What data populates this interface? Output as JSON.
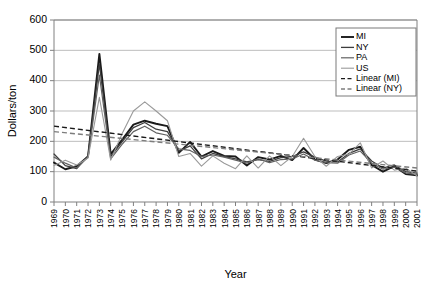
{
  "chart_data": {
    "type": "line",
    "title": "",
    "xlabel": "Year",
    "ylabel": "Dollars/ton",
    "xlim": [
      1969,
      2001
    ],
    "ylim": [
      0,
      600
    ],
    "ytick_step": 100,
    "yticks": [
      0,
      100,
      200,
      300,
      400,
      500,
      600
    ],
    "grid": "horizontal",
    "legend_position": "top-right",
    "categories": [
      "1969",
      "1970",
      "1971",
      "1972",
      "1973",
      "1974",
      "1975",
      "1976",
      "1977",
      "1978",
      "1979",
      "1980",
      "1981",
      "1982",
      "1983",
      "1984",
      "1985",
      "1986",
      "1987",
      "1988",
      "1989",
      "1990",
      "1991",
      "1992",
      "1993",
      "1994",
      "1995",
      "1996",
      "1997",
      "1998",
      "1999",
      "2000",
      "2001"
    ],
    "series": [
      {
        "name": "MI",
        "color": "#1a1a1a",
        "width": 1.9,
        "dash": "none",
        "values": [
          130,
          108,
          118,
          150,
          488,
          158,
          205,
          255,
          268,
          258,
          250,
          162,
          198,
          150,
          168,
          152,
          150,
          120,
          148,
          140,
          152,
          138,
          178,
          140,
          128,
          140,
          172,
          182,
          122,
          100,
          118,
          92,
          88
        ]
      },
      {
        "name": "NY",
        "color": "#3d3d3d",
        "width": 1.3,
        "dash": "none",
        "values": [
          158,
          120,
          110,
          152,
          455,
          150,
          198,
          245,
          262,
          240,
          232,
          168,
          185,
          142,
          160,
          150,
          142,
          132,
          140,
          134,
          146,
          150,
          165,
          148,
          135,
          132,
          160,
          175,
          135,
          112,
          122,
          100,
          95
        ]
      },
      {
        "name": "PA",
        "color": "#616161",
        "width": 1.2,
        "dash": "none",
        "values": [
          148,
          128,
          112,
          148,
          418,
          142,
          190,
          232,
          250,
          228,
          220,
          175,
          170,
          150,
          155,
          148,
          138,
          128,
          142,
          130,
          140,
          142,
          158,
          138,
          130,
          128,
          155,
          168,
          128,
          108,
          115,
          96,
          90
        ]
      },
      {
        "name": "US",
        "color": "#9a9a9a",
        "width": 1.1,
        "dash": "none",
        "values": [
          120,
          138,
          122,
          145,
          345,
          138,
          225,
          300,
          330,
          300,
          268,
          150,
          160,
          118,
          152,
          128,
          110,
          152,
          112,
          152,
          120,
          150,
          210,
          150,
          118,
          150,
          158,
          195,
          112,
          135,
          105,
          112,
          86
        ]
      }
    ],
    "trendlines": [
      {
        "name": "Linear (MI)",
        "color": "#1a1a1a",
        "width": 1.4,
        "dash": "5,3",
        "start": [
          1969,
          250
        ],
        "end": [
          2001,
          102
        ]
      },
      {
        "name": "Linear (NY)",
        "color": "#7d7d7d",
        "width": 1.4,
        "dash": "5,3",
        "start": [
          1969,
          232
        ],
        "end": [
          2001,
          112
        ]
      }
    ],
    "legend_entries": [
      {
        "label": "MI",
        "color": "#1a1a1a",
        "dash": "none",
        "width": 1.9
      },
      {
        "label": "NY",
        "color": "#3d3d3d",
        "dash": "none",
        "width": 1.3
      },
      {
        "label": "PA",
        "color": "#616161",
        "dash": "none",
        "width": 1.2
      },
      {
        "label": "US",
        "color": "#9a9a9a",
        "dash": "none",
        "width": 1.1
      },
      {
        "label": "Linear (MI)",
        "color": "#1a1a1a",
        "dash": "4,2.5",
        "width": 1.3
      },
      {
        "label": "Linear (NY)",
        "color": "#7d7d7d",
        "dash": "4,2.5",
        "width": 1.3
      }
    ]
  }
}
